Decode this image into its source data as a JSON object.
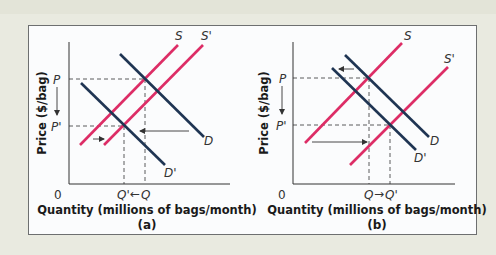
{
  "figure": {
    "colors": {
      "supply": "#dd2d66",
      "demand": "#1f3553",
      "axis": "#333333",
      "background": "#e9eae0",
      "panel": "#fbfcfd"
    },
    "panels": [
      {
        "id": "a",
        "caption": "(a)",
        "x_axis_title": "Quantity (millions of bags/month)",
        "y_axis_title": "Price ($/bag)",
        "origin_label": "0",
        "price_labels": {
          "initial": "P",
          "new": "P'"
        },
        "quantity_labels": {
          "initial": "Q",
          "new": "Q'",
          "arrow": "←"
        },
        "curves": [
          {
            "name": "S",
            "label": "S",
            "type": "supply"
          },
          {
            "name": "S'",
            "label": "S'",
            "type": "supply"
          },
          {
            "name": "D",
            "label": "D",
            "type": "demand"
          },
          {
            "name": "D'",
            "label": "D'",
            "type": "demand"
          }
        ],
        "shifts": [
          "Supply shifts right (small)",
          "Demand shifts left (large)"
        ],
        "result": "Price falls P→P', quantity falls Q→Q'"
      },
      {
        "id": "b",
        "caption": "(b)",
        "x_axis_title": "Quantity (millions of bags/month)",
        "y_axis_title": "Price ($/bag)",
        "origin_label": "0",
        "price_labels": {
          "initial": "P",
          "new": "P'"
        },
        "quantity_labels": {
          "initial": "Q",
          "new": "Q'",
          "arrow": "→"
        },
        "curves": [
          {
            "name": "S",
            "label": "S",
            "type": "supply"
          },
          {
            "name": "S'",
            "label": "S'",
            "type": "supply"
          },
          {
            "name": "D",
            "label": "D",
            "type": "demand"
          },
          {
            "name": "D'",
            "label": "D'",
            "type": "demand"
          }
        ],
        "shifts": [
          "Supply shifts right (large)",
          "Demand shifts left (small)"
        ],
        "result": "Price falls P→P', quantity rises Q→Q'"
      }
    ]
  }
}
